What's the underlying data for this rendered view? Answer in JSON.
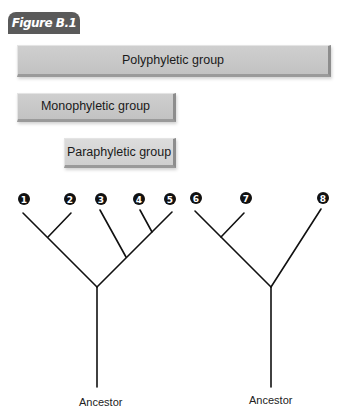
{
  "figure": {
    "title": "Figure B.1"
  },
  "groups": {
    "polyphyletic": "Polyphyletic group",
    "monophyletic": "Monophyletic group",
    "paraphyletic": "Paraphyletic group"
  },
  "trees": {
    "left": {
      "nodes": [
        "1",
        "2",
        "3",
        "4",
        "5"
      ],
      "ancestor_label": "Ancestor"
    },
    "right": {
      "nodes": [
        "6",
        "7",
        "8"
      ],
      "ancestor_label": "Ancestor"
    }
  },
  "colors": {
    "tab": "#5a5a5a",
    "bar": "#c8c8c8",
    "line": "#111111",
    "node": "#111111"
  }
}
